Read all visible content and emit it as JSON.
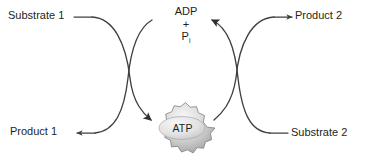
{
  "diagram": {
    "background_color": "#ffffff",
    "stroke_color": "#3f3f3f",
    "text_color": "#231f20",
    "labels": {
      "substrate1": "Substrate 1",
      "product1": "Product 1",
      "product2": "Product 2",
      "substrate2": "Substrate 2",
      "adp": "ADP",
      "plus": "+",
      "pi_symbol": "P",
      "pi_subscript": "i",
      "atp": "ATP"
    },
    "burst": {
      "fill_light": "#f2f2f2",
      "fill_mid": "#cfcfcf",
      "fill_dark": "#9a9a9a",
      "outline": "#8c8c8c",
      "points": 18,
      "center_x": 182,
      "center_y": 128,
      "outer_rx": 33,
      "outer_ry": 18,
      "inner_rx": 23,
      "inner_ry": 11
    },
    "arrows": [
      {
        "name": "substrate1-to-product2",
        "from": "Substrate 1",
        "to": "Product 2",
        "head": "right"
      },
      {
        "name": "substrate2-to-product1",
        "from": "Substrate 2",
        "to": "Product 1",
        "head": "left"
      },
      {
        "name": "adp-pi-to-atp",
        "from": "ADP + Pi",
        "to": "ATP",
        "head": "down-right"
      },
      {
        "name": "atp-to-adp-pi",
        "from": "ATP",
        "to": "ADP + Pi",
        "head": "up-left"
      }
    ]
  }
}
